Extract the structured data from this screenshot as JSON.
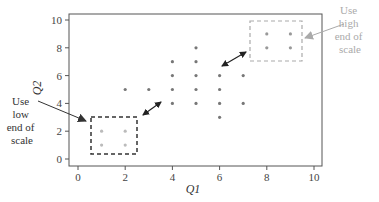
{
  "chart_data": {
    "type": "scatter",
    "title": "",
    "xlabel": "Q1",
    "ylabel": "Q2",
    "xlim": [
      -0.4,
      10.3
    ],
    "ylim": [
      -0.5,
      10.5
    ],
    "xticks": [
      0,
      2,
      4,
      6,
      8,
      10
    ],
    "yticks": [
      0,
      2,
      4,
      6,
      8,
      10
    ],
    "grid": false,
    "legend": null,
    "series": [
      {
        "name": "main",
        "color": "#777777",
        "points": [
          [
            2,
            5
          ],
          [
            3,
            5
          ],
          [
            4,
            7
          ],
          [
            4,
            6
          ],
          [
            4,
            5
          ],
          [
            4,
            4
          ],
          [
            5,
            8
          ],
          [
            5,
            7
          ],
          [
            5,
            6
          ],
          [
            5,
            5
          ],
          [
            5,
            4
          ],
          [
            6,
            6
          ],
          [
            6,
            5
          ],
          [
            6,
            4
          ],
          [
            6,
            3
          ],
          [
            7,
            6
          ],
          [
            7,
            4
          ]
        ]
      },
      {
        "name": "high-end",
        "color": "#999999",
        "points": [
          [
            8,
            9
          ],
          [
            9,
            9
          ],
          [
            8,
            8
          ],
          [
            9,
            8
          ]
        ]
      },
      {
        "name": "low-end",
        "color": "#bbbbbb",
        "points": [
          [
            1,
            2
          ],
          [
            2,
            2
          ],
          [
            1,
            1
          ],
          [
            2,
            1
          ]
        ]
      }
    ],
    "annotations": [
      {
        "id": "high",
        "text_lines": [
          "Use",
          "high",
          "end of",
          "scale"
        ],
        "color": "#aaaaaa",
        "box": {
          "x0": 7.3,
          "x1": 9.5,
          "y0": 7.2,
          "y1": 10.0,
          "style": "dashed"
        }
      },
      {
        "id": "low",
        "text_lines": [
          "Use",
          "low",
          "end of",
          "scale"
        ],
        "color": "#333333",
        "box": {
          "x0": 0.55,
          "x1": 2.5,
          "y0": 0.3,
          "y1": 3.0,
          "style": "dashed"
        }
      }
    ],
    "double_arrows": [
      {
        "from": [
          2.8,
          3.2
        ],
        "to": [
          3.6,
          4.1
        ]
      },
      {
        "from": [
          6.1,
          6.6
        ],
        "to": [
          7.1,
          7.6
        ]
      }
    ]
  },
  "labels": {
    "xlabel": "Q1",
    "ylabel": "Q2",
    "xticks": [
      "0",
      "2",
      "4",
      "6",
      "8",
      "10"
    ],
    "yticks": [
      "0",
      "2",
      "4",
      "6",
      "8",
      "10"
    ],
    "high_anno": [
      "Use",
      "high",
      "end of",
      "scale"
    ],
    "low_anno": [
      "Use",
      "low",
      "end of",
      "scale"
    ]
  }
}
